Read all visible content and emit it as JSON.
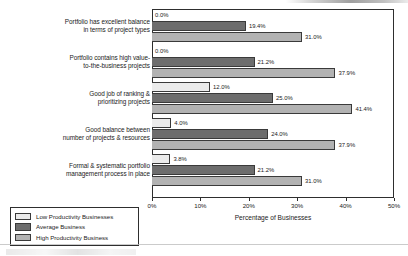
{
  "chart_data": {
    "type": "bar",
    "orientation": "horizontal",
    "title": "",
    "xlabel": "Percentage of Businesses",
    "ylabel": "",
    "xlim": [
      0,
      50
    ],
    "xtick_labels": [
      "0%",
      "10%",
      "20%",
      "30%",
      "40%",
      "50%"
    ],
    "xtick_values": [
      0,
      10,
      20,
      30,
      40,
      50
    ],
    "grid": false,
    "legend_position": "bottom-left",
    "value_label_suffix": "%",
    "categories": [
      "Portfolio has excellent balance in terms of project types",
      "Portfolio contains high value-to-the-business projects",
      "Good job of ranking & prioritizing projects",
      "Good balance between number of projects & resources",
      "Formal & systematic portfolio management process in place"
    ],
    "category_lines": [
      [
        "Portfolio has excellent balance",
        "in terms of project types"
      ],
      [
        "Portfolio contains high value-",
        "to-the-business projects"
      ],
      [
        "Good job of ranking &",
        "prioritizing projects"
      ],
      [
        "Good balance between",
        "number of projects & resources"
      ],
      [
        "Formal & systematic portfolio",
        "management process in place"
      ]
    ],
    "series": [
      {
        "name": "Low Productivity Businesses",
        "color": "#ebebeb",
        "values": [
          0.0,
          0.0,
          12.0,
          4.0,
          3.8
        ],
        "labels": [
          "0.0%",
          "0.0%",
          "12.0%",
          "4.0%",
          "3.8%"
        ]
      },
      {
        "name": "Average Business",
        "color": "#6d6d6d",
        "values": [
          19.4,
          21.2,
          25.0,
          24.0,
          21.2
        ],
        "labels": [
          "19.4%",
          "21.2%",
          "25.0%",
          "24.0%",
          "21.2%"
        ]
      },
      {
        "name": "High Productivity Business",
        "color": "#b2b2b2",
        "values": [
          31.0,
          37.9,
          41.4,
          37.9,
          31.0
        ],
        "labels": [
          "31.0%",
          "37.9%",
          "41.4%",
          "37.9%",
          "31.0%"
        ]
      }
    ]
  },
  "legend": {
    "items": [
      {
        "label": "Low Productivity Businesses",
        "swatch": "low"
      },
      {
        "label": "Average Business",
        "swatch": "avg"
      },
      {
        "label": "High Productivity Business",
        "swatch": "high"
      }
    ]
  }
}
